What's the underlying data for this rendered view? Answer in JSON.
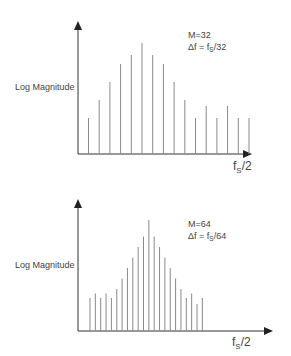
{
  "chart_data": [
    {
      "type": "bar",
      "title": "",
      "ylabel": "Log Magnitude",
      "xlabel": "fS/2",
      "annotation": [
        "M=32",
        "Δf = fS/32"
      ],
      "params": {
        "M": 32,
        "delta_f": "fS/32"
      },
      "bar_style": "stem",
      "bar_count": 16,
      "values": [
        12,
        18,
        24,
        30,
        33,
        37,
        33,
        30,
        24,
        18,
        12,
        16,
        12,
        16,
        12,
        12
      ],
      "ylim": [
        0,
        42
      ]
    },
    {
      "type": "bar",
      "title": "",
      "ylabel": "Log Magnitude",
      "xlabel": "fS/2",
      "annotation": [
        "M=64",
        "Δf = fS/64"
      ],
      "params": {
        "M": 64,
        "delta_f": "fS/64"
      },
      "bar_style": "stem",
      "bar_count": 22,
      "values": [
        11,
        12.5,
        11,
        12.5,
        11,
        14,
        17.5,
        21,
        24.5,
        28,
        31.5,
        37,
        31.5,
        28,
        24.5,
        21,
        17.5,
        14,
        11,
        12.5,
        9,
        11
      ],
      "ylim": [
        0,
        42
      ]
    }
  ],
  "top": {
    "ylabel": "Log Magnitude",
    "m_label": "M=32",
    "df_prefix": "Δf = f",
    "df_sub": "S",
    "df_suffix": "/32",
    "x_main": "f",
    "x_sub": "S",
    "x_suffix": "/2"
  },
  "bottom": {
    "ylabel": "Log Magnitude",
    "m_label": "M=64",
    "df_prefix": "Δf = f",
    "df_sub": "S",
    "df_suffix": "/64",
    "x_main": "f",
    "x_sub": "S",
    "x_suffix": "/2"
  },
  "colors": {
    "axis": "#333333",
    "bar": "#8a8a8a",
    "text": "#444444"
  }
}
